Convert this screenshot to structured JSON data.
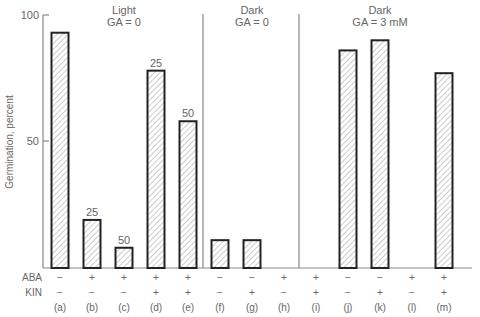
{
  "chart_data": {
    "type": "bar",
    "title": "",
    "xlabel": "",
    "ylabel": "Germination, percent",
    "ylim": [
      0,
      100
    ],
    "yticks": [
      50,
      100
    ],
    "grid": false,
    "categories": [
      "(a)",
      "(b)",
      "(c)",
      "(d)",
      "(e)",
      "(f)",
      "(g)",
      "(h)",
      "(i)",
      "(j)",
      "(k)",
      "(l)",
      "(m)"
    ],
    "values": [
      93,
      19,
      8,
      78,
      58,
      11,
      11,
      0,
      0,
      86,
      90,
      0,
      77
    ],
    "bar_annotations": [
      "",
      "25",
      "50",
      "25",
      "50",
      "",
      "",
      "",
      "",
      "",
      "",
      "",
      ""
    ],
    "row_labels": {
      "ABA": [
        "−",
        "+",
        "+",
        "+",
        "+",
        "−",
        "−",
        "+",
        "+",
        "−",
        "−",
        "+",
        "+"
      ],
      "KIN": [
        "−",
        "−",
        "−",
        "+",
        "+",
        "−",
        "+",
        "−",
        "+",
        "−",
        "+",
        "−",
        "+"
      ]
    },
    "groups": [
      {
        "label_line1": "Light",
        "label_line2": "GA = 0",
        "bars": [
          "(a)",
          "(b)",
          "(c)",
          "(d)",
          "(e)"
        ]
      },
      {
        "label_line1": "Dark",
        "label_line2": "GA = 0",
        "bars": [
          "(f)",
          "(g)",
          "(h)"
        ]
      },
      {
        "label_line1": "Dark",
        "label_line2": "GA = 3 mM",
        "bars": [
          "(i)",
          "(j)",
          "(k)",
          "(l)",
          "(m)"
        ]
      }
    ],
    "bar_fill": "hatched",
    "bar_edge_color": "#222222"
  },
  "axis": {
    "ylabel": "Germination, percent",
    "tick_100": "100",
    "tick_50": "50"
  },
  "rows": {
    "aba_label": "ABA",
    "kin_label": "KIN"
  }
}
